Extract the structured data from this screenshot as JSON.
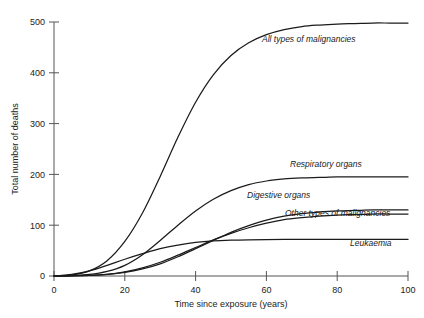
{
  "figure": {
    "background": "#ffffff",
    "line_color": "#1b1b1b",
    "axis_color": "#555555"
  },
  "chart_data": {
    "type": "line",
    "title": "",
    "xlabel": "Time since exposure (years)",
    "ylabel": "Total number of deaths",
    "xlim": [
      0,
      100
    ],
    "ylim": [
      0,
      500
    ],
    "xticks": [
      0,
      20,
      40,
      60,
      80,
      100
    ],
    "yticks": [
      0,
      100,
      200,
      300,
      400,
      500
    ],
    "xticklabels": [
      "0",
      "20",
      "40",
      "60",
      "80",
      "100"
    ],
    "yticklabels": [
      "0",
      "100",
      "200",
      "300",
      "400",
      "500"
    ],
    "grid": false,
    "legend": "inline-curve-labels",
    "x": [
      0,
      5,
      10,
      15,
      20,
      25,
      30,
      35,
      40,
      45,
      50,
      55,
      60,
      65,
      70,
      75,
      80,
      85,
      90,
      95,
      100
    ],
    "series": [
      {
        "name": "All types of malignancies",
        "label": "All types of malignancies",
        "plateau": 498,
        "values": [
          0,
          2,
          10,
          30,
          68,
          124,
          196,
          273,
          342,
          396,
          434,
          459,
          475,
          485,
          491,
          494,
          496,
          497,
          498,
          498,
          498
        ]
      },
      {
        "name": "Respiratory organs",
        "label": "Respiratory organs",
        "plateau": 195,
        "values": [
          0,
          1,
          3,
          9,
          21,
          42,
          70,
          100,
          128,
          151,
          168,
          180,
          187,
          191,
          193,
          194,
          195,
          195,
          195,
          195,
          195
        ]
      },
      {
        "name": "Digestive organs",
        "label": "Digestive organs",
        "plateau": 130,
        "values": [
          0,
          0,
          1,
          3,
          7,
          14,
          24,
          38,
          54,
          70,
          86,
          99,
          110,
          118,
          123,
          126,
          128,
          129,
          130,
          130,
          130
        ]
      },
      {
        "name": "Other types of malignancies",
        "label": "Other types of malignancies",
        "plateau": 122,
        "values": [
          0,
          0,
          1,
          3,
          8,
          16,
          27,
          41,
          56,
          71,
          84,
          95,
          104,
          111,
          115,
          118,
          120,
          121,
          122,
          122,
          122
        ]
      },
      {
        "name": "Leukaemia",
        "label": "Leukaemia",
        "plateau": 72,
        "values": [
          0,
          3,
          10,
          21,
          33,
          44,
          54,
          61,
          66,
          69,
          70.5,
          71.3,
          71.7,
          71.9,
          72,
          72,
          72,
          72,
          72,
          72,
          72
        ]
      }
    ]
  },
  "header": {
    "text": ""
  }
}
